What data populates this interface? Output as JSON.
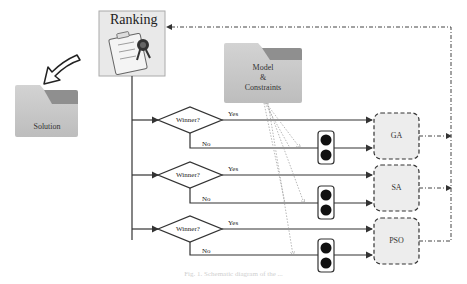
{
  "ranking": {
    "title": "Ranking",
    "checklist_items": [
      "Agent1",
      "Agent2",
      "Agent3"
    ]
  },
  "solution": {
    "label": "Solution"
  },
  "model": {
    "line1": "Model",
    "line2": "&",
    "line3": "Constraints"
  },
  "decisions": [
    {
      "label": "Winner?",
      "yes": "Yes",
      "no": "No"
    },
    {
      "label": "Winner?",
      "yes": "Yes",
      "no": "No"
    },
    {
      "label": "Winner?",
      "yes": "Yes",
      "no": "No"
    }
  ],
  "algorithms": [
    {
      "label": "GA"
    },
    {
      "label": "SA"
    },
    {
      "label": "PSO"
    }
  ],
  "caption": "Fig. 1. Schematic diagram of the ...",
  "colors": {
    "folder_body": "#c8c8c8",
    "folder_tab": "#8f8f8f",
    "algo_fill": "#ececec",
    "line": "#333333",
    "dotted": "#999999"
  }
}
